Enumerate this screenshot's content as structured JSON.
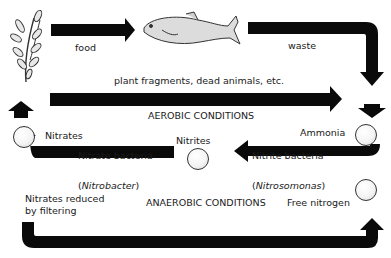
{
  "diagram": {
    "type": "nitrogen cycle in aquarium",
    "labels": {
      "food": "food",
      "waste": "waste",
      "plant_fragments": "plant fragments, dead animals, etc.",
      "aerobic": "AEROBIC CONDITIONS",
      "anaerobic": "ANAEROBIC CONDITIONS",
      "nitrates": "Nitrates",
      "nitrites": "Nitrites",
      "ammonia": "Ammonia",
      "free_nitrogen": "Free nitrogen",
      "nitrate_bacteria": "Nitrate bacteria",
      "nitrobacter_open": "(",
      "nitrobacter": "Nitrobacter",
      "nitrobacter_close": ")",
      "nitrite_bacteria": "Nitrite bacteria",
      "nitrosomonas_open": "(",
      "nitrosomonas": "Nitrosomonas",
      "nitrosomonas_close": ")",
      "nitrates_reduced_line1": "Nitrates reduced",
      "nitrates_reduced_line2": "by filtering"
    },
    "nodes": [
      "plant",
      "fish",
      "Ammonia",
      "Nitrites",
      "Nitrates",
      "Free nitrogen"
    ],
    "colors": {
      "arrow": "#0a0a0a",
      "text": "#1a1a1a",
      "background": "#ffffff"
    }
  }
}
